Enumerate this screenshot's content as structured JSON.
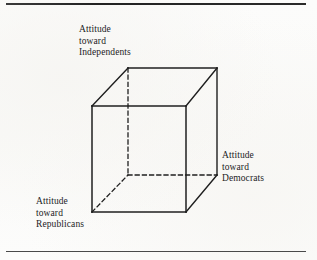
{
  "figure": {
    "type": "3d-cube-diagram",
    "background_color": "#fdfdfc",
    "line_color": "#1f1f1f",
    "rules": {
      "top_rule_color": "#2b2b2b",
      "bottom_rule_color": "#4a4a4a"
    },
    "axis_labels": [
      {
        "id": "independents",
        "position": "top-left",
        "lines": [
          "Attitude",
          "toward",
          "Independents"
        ]
      },
      {
        "id": "democrats",
        "position": "right",
        "lines": [
          "Attitude",
          "toward",
          "Democrats"
        ]
      },
      {
        "id": "republicans",
        "position": "bottom-left",
        "lines": [
          "Attitude",
          "toward",
          "Republicans"
        ]
      }
    ],
    "cube": {
      "front_face": {
        "top_left": [
          92,
          106
        ],
        "top_right": [
          186,
          106
        ],
        "bottom_right": [
          186,
          212
        ],
        "bottom_left": [
          92,
          212
        ],
        "style": "solid"
      },
      "back_face": {
        "top_left": [
          128,
          68
        ],
        "top_right": [
          217,
          68
        ],
        "bottom_right": [
          217,
          175
        ],
        "bottom_left": [
          128,
          175
        ],
        "hidden_edges_style": "dashed"
      },
      "connectors": [
        {
          "from": [
            92,
            106
          ],
          "to": [
            128,
            68
          ],
          "style": "solid"
        },
        {
          "from": [
            186,
            106
          ],
          "to": [
            217,
            68
          ],
          "style": "solid"
        },
        {
          "from": [
            186,
            212
          ],
          "to": [
            217,
            175
          ],
          "style": "solid"
        },
        {
          "from": [
            92,
            212
          ],
          "to": [
            128,
            175
          ],
          "style": "dashed"
        }
      ],
      "hidden_edges": [
        {
          "from": [
            128,
            68
          ],
          "to": [
            128,
            175
          ],
          "style": "dashed"
        },
        {
          "from": [
            128,
            175
          ],
          "to": [
            217,
            175
          ],
          "style": "dashed"
        }
      ]
    }
  }
}
